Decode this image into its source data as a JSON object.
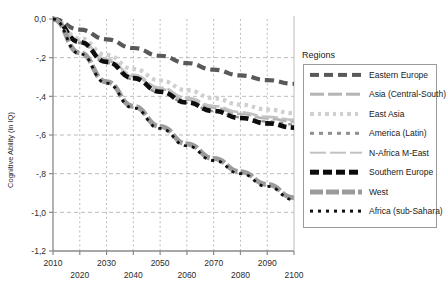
{
  "chart_data": {
    "type": "line",
    "title": "",
    "xlabel": "",
    "ylabel": "Cognitive Ability (in IQ)",
    "xlim": [
      2010,
      2100
    ],
    "ylim": [
      -1.2,
      0.0
    ],
    "grid": true,
    "legend_position": "right",
    "legend_title": "Regions",
    "xticks_upper": [
      "2010",
      "2030",
      "2050",
      "2070",
      "2090"
    ],
    "xticks_lower": [
      "2020",
      "2040",
      "2060",
      "2080",
      "2100"
    ],
    "xtick_values_upper": [
      2010,
      2030,
      2050,
      2070,
      2090
    ],
    "xtick_values_lower": [
      2020,
      2040,
      2060,
      2080,
      2100
    ],
    "yticks": [
      "0,0",
      "-,2",
      "-,4",
      "-,6",
      "-,8",
      "-1,0",
      "-1,2"
    ],
    "ytick_values": [
      0.0,
      -0.2,
      -0.4,
      -0.6,
      -0.8,
      -1.0,
      -1.2
    ],
    "x": [
      2010,
      2020,
      2030,
      2040,
      2050,
      2060,
      2070,
      2080,
      2090,
      2100
    ],
    "series": [
      {
        "name": "Eastern Europe",
        "color": "#595959",
        "dash": "9,5",
        "width": 4.2,
        "values": [
          0.0,
          -0.055,
          -0.105,
          -0.15,
          -0.19,
          -0.228,
          -0.262,
          -0.292,
          -0.316,
          -0.335
        ]
      },
      {
        "name": "Asia (Central-South)",
        "color": "#b4b4b4",
        "dash": "14,4",
        "width": 2.6,
        "values": [
          0.0,
          -0.118,
          -0.216,
          -0.297,
          -0.363,
          -0.417,
          -0.459,
          -0.491,
          -0.514,
          -0.53
        ]
      },
      {
        "name": "East Asia",
        "color": "#cfcfcf",
        "dash": "3.5,4",
        "width": 4.2,
        "values": [
          0.0,
          -0.1,
          -0.186,
          -0.258,
          -0.318,
          -0.368,
          -0.41,
          -0.443,
          -0.468,
          -0.487
        ]
      },
      {
        "name": "America (Latin)",
        "color": "#8f8f8f",
        "dash": "4,5",
        "width": 2.4,
        "values": [
          0.0,
          -0.124,
          -0.228,
          -0.312,
          -0.38,
          -0.434,
          -0.476,
          -0.508,
          -0.53,
          -0.545
        ]
      },
      {
        "name": "N-Africa M-East",
        "color": "#c2c2c2",
        "dash": "16,4",
        "width": 2.6,
        "values": [
          0.0,
          -0.112,
          -0.208,
          -0.288,
          -0.354,
          -0.408,
          -0.45,
          -0.482,
          -0.506,
          -0.522
        ]
      },
      {
        "name": "Southern Europe",
        "color": "#0d0d0d",
        "dash": "8.5,4.5",
        "width": 4.6,
        "values": [
          0.0,
          -0.12,
          -0.222,
          -0.306,
          -0.376,
          -0.432,
          -0.476,
          -0.512,
          -0.54,
          -0.562
        ]
      },
      {
        "name": "West",
        "color": "#9b9b9b",
        "dash": "13,3",
        "width": 5.0,
        "values": [
          0.0,
          -0.175,
          -0.325,
          -0.452,
          -0.556,
          -0.646,
          -0.722,
          -0.79,
          -0.856,
          -0.925
        ]
      },
      {
        "name": "Africa (sub-Sahara)",
        "color": "#101010",
        "dash": "3,5",
        "width": 2.8,
        "values": [
          0.0,
          -0.18,
          -0.332,
          -0.46,
          -0.566,
          -0.656,
          -0.732,
          -0.8,
          -0.866,
          -0.935
        ]
      }
    ]
  }
}
